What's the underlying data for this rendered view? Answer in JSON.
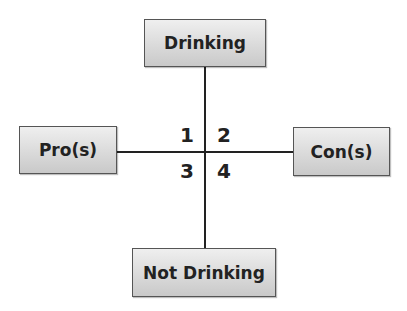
{
  "diagram": {
    "nodes": {
      "top": "Drinking",
      "left": "Pro(s)",
      "right": "Con(s)",
      "bottom": "Not Drinking"
    },
    "quadrants": [
      "1",
      "2",
      "3",
      "4"
    ]
  }
}
